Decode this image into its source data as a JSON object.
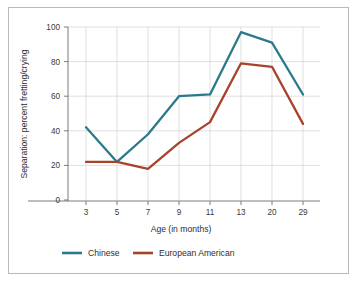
{
  "chart_data": {
    "type": "line",
    "title": "",
    "xlabel": "Age (in months)",
    "ylabel": "Separation: percent fretting/crying",
    "categories": [
      "3",
      "5",
      "7",
      "9",
      "11",
      "13",
      "20",
      "29"
    ],
    "x_tick_labels": [
      "3",
      "5",
      "7",
      "9",
      "11",
      "13",
      "20",
      "29"
    ],
    "y_tick_labels": [
      "0",
      "20",
      "40",
      "60",
      "80",
      "100"
    ],
    "y_ticks": [
      0,
      20,
      40,
      60,
      80,
      100
    ],
    "ylim": [
      0,
      100
    ],
    "grid": "horizontal-and-vertical",
    "legend_position": "bottom",
    "series": [
      {
        "name": "Chinese",
        "color": "#2a7a8c",
        "values": [
          42,
          22,
          38,
          60,
          61,
          97,
          91,
          61
        ]
      },
      {
        "name": "European American",
        "color": "#a8432b",
        "values": [
          22,
          22,
          18,
          33,
          45,
          79,
          77,
          44
        ]
      }
    ]
  },
  "legend": {
    "items": [
      {
        "label": "Chinese",
        "color": "#2a7a8c"
      },
      {
        "label": "European American",
        "color": "#a8432b"
      }
    ]
  },
  "colors": {
    "chinese": "#2a7a8c",
    "european_american": "#a8432b",
    "frame": "#b9b9b9",
    "grid": "#d2d2d2",
    "axis": "#6e6e6e",
    "text": "#2e2e2e",
    "background": "#ffffff"
  }
}
